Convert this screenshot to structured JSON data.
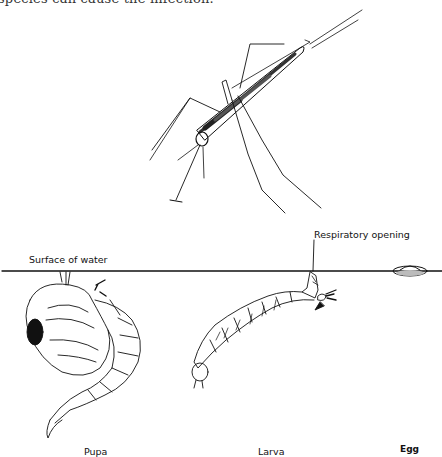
{
  "document": {
    "top_text_fragment": "species can cause the infection.",
    "figure": {
      "subject": "mosquito life cycle",
      "labels": {
        "surface": "Surface of water",
        "respiratory": "Respiratory opening",
        "pupa": "Pupa",
        "larva": "Larva",
        "egg": "Egg"
      },
      "stages": [
        "Adult",
        "Pupa",
        "Larva",
        "Egg"
      ]
    }
  }
}
